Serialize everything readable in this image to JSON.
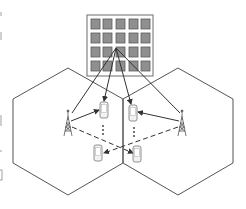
{
  "diagram": {
    "title": "",
    "colors": {
      "background": "#ffffff",
      "line": "#555555",
      "ris_frame": "#6b6b6b",
      "ris_element": "#8f8f8f",
      "ris_element_border": "#5a5a5a",
      "device_fill": "#f2f2f2",
      "device_stroke": "#777777",
      "arrow": "#333333"
    },
    "ris": {
      "label": "",
      "rows": 4,
      "cols": 5,
      "frame": {
        "x": 87,
        "y": 15,
        "w": 66,
        "h": 61
      },
      "origin": {
        "x": 116,
        "y": 48
      }
    },
    "cells": [
      {
        "id": "left-cell",
        "points": "68,68 123,99 123,163 68,195 13,163 13,99"
      },
      {
        "id": "right-cell",
        "points": "178,68 233,99 233,163 178,195 123,163 123,99"
      }
    ],
    "towers": [
      {
        "id": "left-tower",
        "x": 68,
        "y": 113
      },
      {
        "id": "right-tower",
        "x": 182,
        "y": 113
      }
    ],
    "devices": [
      {
        "id": "left-top-device",
        "x": 104,
        "y": 110
      },
      {
        "id": "left-bottom-device",
        "x": 98,
        "y": 152
      },
      {
        "id": "right-top-device",
        "x": 133,
        "y": 112
      },
      {
        "id": "right-bottom-device",
        "x": 137,
        "y": 154
      }
    ],
    "ellipsis": "⋮"
  }
}
